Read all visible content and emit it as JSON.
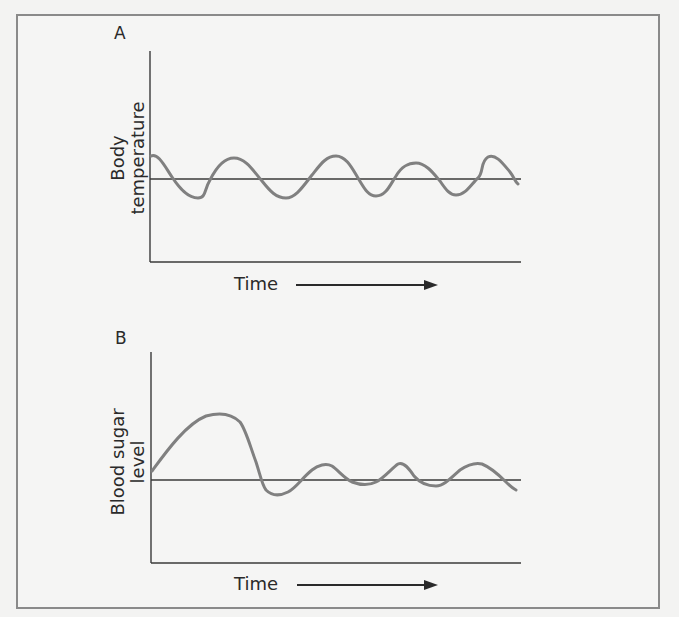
{
  "figure": {
    "panels": [
      {
        "letter": "A",
        "ylabel_line1": "Body",
        "ylabel_line2": "temperature",
        "xlabel": "Time",
        "description": "Body temperature oscillates around a set point (horizontal line) over time"
      },
      {
        "letter": "B",
        "ylabel_line1": "Blood sugar",
        "ylabel_line2": "level",
        "xlabel": "Time",
        "description": "Blood sugar level spikes above the set point then returns and oscillates around it over time"
      }
    ]
  },
  "colors": {
    "background": "#f5f5f4",
    "frame": "#8a8a8a",
    "axis": "#3a3a3a",
    "curve": "#808080",
    "text": "#2a2a2a"
  }
}
